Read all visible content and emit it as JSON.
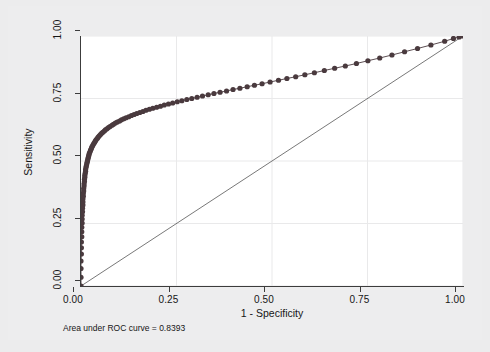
{
  "chart_data": {
    "type": "line",
    "title": "",
    "subtitle": "",
    "xlabel": "1 - Specificity",
    "ylabel": "Sensitivity",
    "xlim": [
      0,
      1
    ],
    "ylim": [
      0,
      1
    ],
    "xticks": [
      "0.00",
      "0.25",
      "0.50",
      "0.75",
      "1.00"
    ],
    "xtick_values": [
      0,
      0.25,
      0.5,
      0.75,
      1
    ],
    "yticks": [
      "0.00",
      "0.25",
      "0.50",
      "0.75",
      "1.00"
    ],
    "ytick_values": [
      0,
      0.25,
      0.5,
      0.75,
      1
    ],
    "grid": true,
    "legend": "none",
    "annotation": "Area under ROC curve = 0.8393",
    "auc": 0.8393,
    "series": [
      {
        "name": "ROC curve",
        "marker": "circle",
        "color": "#4a3a3e",
        "x": [
          0.0,
          0.0,
          0.0,
          0.0,
          0.001,
          0.001,
          0.001,
          0.002,
          0.002,
          0.002,
          0.003,
          0.003,
          0.003,
          0.004,
          0.004,
          0.005,
          0.005,
          0.005,
          0.006,
          0.006,
          0.007,
          0.007,
          0.008,
          0.008,
          0.009,
          0.009,
          0.01,
          0.01,
          0.011,
          0.012,
          0.012,
          0.013,
          0.014,
          0.015,
          0.016,
          0.017,
          0.018,
          0.019,
          0.02,
          0.021,
          0.022,
          0.024,
          0.025,
          0.027,
          0.028,
          0.03,
          0.032,
          0.034,
          0.036,
          0.038,
          0.04,
          0.043,
          0.045,
          0.048,
          0.051,
          0.054,
          0.057,
          0.061,
          0.064,
          0.068,
          0.072,
          0.076,
          0.081,
          0.085,
          0.09,
          0.095,
          0.101,
          0.106,
          0.112,
          0.118,
          0.125,
          0.132,
          0.139,
          0.146,
          0.154,
          0.162,
          0.17,
          0.179,
          0.188,
          0.198,
          0.208,
          0.218,
          0.229,
          0.24,
          0.252,
          0.264,
          0.277,
          0.29,
          0.304,
          0.318,
          0.333,
          0.348,
          0.364,
          0.381,
          0.398,
          0.416,
          0.435,
          0.454,
          0.474,
          0.495,
          0.517,
          0.539,
          0.562,
          0.586,
          0.611,
          0.637,
          0.664,
          0.692,
          0.721,
          0.751,
          0.782,
          0.814,
          0.847,
          0.881,
          0.916,
          0.952,
          0.975,
          0.99,
          1.0
        ],
        "y": [
          0.0,
          0.035,
          0.07,
          0.1,
          0.128,
          0.153,
          0.176,
          0.197,
          0.217,
          0.235,
          0.252,
          0.268,
          0.283,
          0.297,
          0.311,
          0.324,
          0.336,
          0.348,
          0.359,
          0.37,
          0.38,
          0.39,
          0.4,
          0.409,
          0.418,
          0.427,
          0.435,
          0.443,
          0.451,
          0.459,
          0.466,
          0.474,
          0.481,
          0.488,
          0.495,
          0.501,
          0.508,
          0.514,
          0.52,
          0.526,
          0.532,
          0.538,
          0.544,
          0.549,
          0.555,
          0.56,
          0.566,
          0.571,
          0.576,
          0.581,
          0.586,
          0.591,
          0.596,
          0.601,
          0.606,
          0.611,
          0.615,
          0.62,
          0.625,
          0.629,
          0.634,
          0.638,
          0.643,
          0.647,
          0.652,
          0.656,
          0.66,
          0.665,
          0.669,
          0.673,
          0.677,
          0.682,
          0.686,
          0.69,
          0.694,
          0.698,
          0.703,
          0.707,
          0.711,
          0.715,
          0.719,
          0.724,
          0.728,
          0.732,
          0.737,
          0.741,
          0.746,
          0.75,
          0.755,
          0.76,
          0.765,
          0.77,
          0.775,
          0.78,
          0.786,
          0.791,
          0.797,
          0.803,
          0.809,
          0.816,
          0.823,
          0.83,
          0.837,
          0.845,
          0.853,
          0.862,
          0.871,
          0.88,
          0.89,
          0.901,
          0.912,
          0.924,
          0.937,
          0.95,
          0.964,
          0.979,
          0.99,
          0.996,
          1.0
        ]
      },
      {
        "name": "Reference diagonal",
        "marker": "none",
        "color": "#555555",
        "x": [
          0,
          1
        ],
        "y": [
          0,
          1
        ]
      }
    ]
  },
  "axes": {
    "xlabel": "1 - Specificity",
    "ylabel": "Sensitivity",
    "xticks": [
      "0.00",
      "0.25",
      "0.50",
      "0.75",
      "1.00"
    ],
    "yticks": [
      "0.00",
      "0.25",
      "0.50",
      "0.75",
      "1.00"
    ]
  },
  "note": {
    "text": "Area under ROC curve = 0.8393"
  }
}
